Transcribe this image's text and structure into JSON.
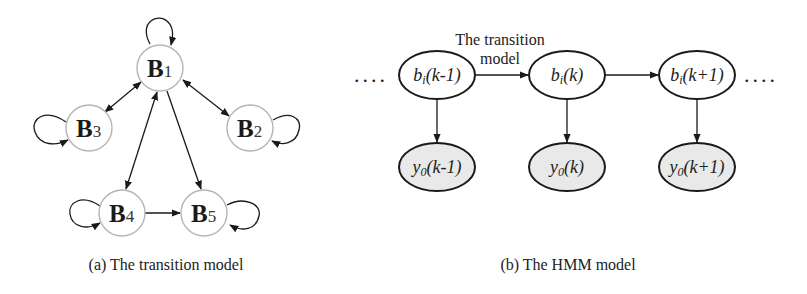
{
  "panel_a": {
    "caption": "(a) The transition model",
    "nodes": [
      {
        "id": "B1",
        "main": "B",
        "sub": "1",
        "cx": 160,
        "cy": 68
      },
      {
        "id": "B2",
        "main": "B",
        "sub": "2",
        "cx": 250,
        "cy": 128
      },
      {
        "id": "B3",
        "main": "B",
        "sub": "3",
        "cx": 89,
        "cy": 128
      },
      {
        "id": "B4",
        "main": "B",
        "sub": "4",
        "cx": 122,
        "cy": 213
      },
      {
        "id": "B5",
        "main": "B",
        "sub": "5",
        "cx": 204,
        "cy": 213
      }
    ],
    "edges": [
      {
        "from": "B1",
        "to": "B1",
        "type": "self-loop"
      },
      {
        "from": "B2",
        "to": "B2",
        "type": "self-loop"
      },
      {
        "from": "B3",
        "to": "B3",
        "type": "self-loop"
      },
      {
        "from": "B4",
        "to": "B4",
        "type": "self-loop"
      },
      {
        "from": "B5",
        "to": "B5",
        "type": "self-loop"
      },
      {
        "from": "B1",
        "to": "B3",
        "type": "bidirectional"
      },
      {
        "from": "B1",
        "to": "B2",
        "type": "bidirectional"
      },
      {
        "from": "B1",
        "to": "B4",
        "type": "bidirectional"
      },
      {
        "from": "B1",
        "to": "B5",
        "type": "directed"
      },
      {
        "from": "B4",
        "to": "B5",
        "type": "directed"
      }
    ]
  },
  "panel_b": {
    "caption": "(b) The HMM model",
    "edge_label_line1": "The transition",
    "edge_label_line2": "model",
    "ellipsis": "....",
    "hidden_nodes": [
      {
        "id": "b_k_minus_1",
        "base": "b",
        "sub": "i",
        "arg": "(k-1)"
      },
      {
        "id": "b_k",
        "base": "b",
        "sub": "i",
        "arg": "(k)"
      },
      {
        "id": "b_k_plus_1",
        "base": "b",
        "sub": "i",
        "arg": "(k+1)"
      }
    ],
    "observed_nodes": [
      {
        "id": "y_k_minus_1",
        "base": "y",
        "sub": "0",
        "arg": "(k-1)"
      },
      {
        "id": "y_k",
        "base": "y",
        "sub": "0",
        "arg": "(k)"
      },
      {
        "id": "y_k_plus_1",
        "base": "y",
        "sub": "0",
        "arg": "(k+1)"
      }
    ],
    "colors": {
      "observed_fill": "#e9e9e9",
      "hidden_fill": "#ffffff"
    }
  }
}
